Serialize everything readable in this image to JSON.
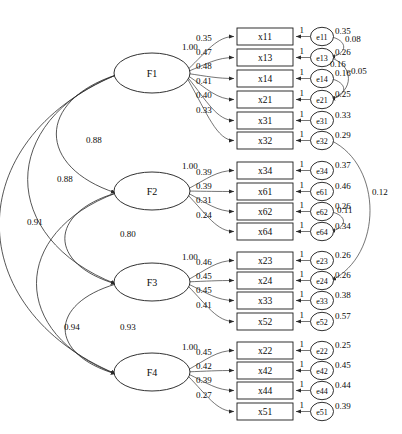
{
  "diagram": {
    "type": "sem-path-diagram",
    "stroke_color": "#2b2b2b",
    "fill_color": "#ffffff",
    "unit_label": "1"
  },
  "factors": [
    {
      "id": "F1",
      "label": "F1",
      "cx": 152,
      "cy": 73,
      "rx": 38,
      "ry": 20,
      "first_loading": "1.00",
      "loadings": [
        "0.35",
        "0.47",
        "0.48",
        "0.41",
        "0.40",
        "0.33"
      ]
    },
    {
      "id": "F2",
      "label": "F2",
      "cx": 152,
      "cy": 191,
      "rx": 38,
      "ry": 19,
      "first_loading": "1.00",
      "loadings": [
        "0.39",
        "0.39",
        "0.31",
        "0.24"
      ]
    },
    {
      "id": "F3",
      "label": "F3",
      "cx": 152,
      "cy": 282,
      "rx": 38,
      "ry": 19,
      "first_loading": "1.00",
      "loadings": [
        "0.46",
        "0.45",
        "0.45",
        "0.41"
      ]
    },
    {
      "id": "F4",
      "label": "F4",
      "cx": 152,
      "cy": 372,
      "rx": 38,
      "ry": 19,
      "first_loading": "1.00",
      "loadings": [
        "0.45",
        "0.42",
        "0.39",
        "0.27"
      ]
    }
  ],
  "indicators": [
    {
      "id": "x11",
      "label": "x11",
      "factor": "F1",
      "y": 28,
      "error": "e11",
      "error_var": "0.35"
    },
    {
      "id": "x13",
      "label": "x13",
      "factor": "F1",
      "y": 49,
      "error": "e13",
      "error_var": "0.26"
    },
    {
      "id": "x14",
      "label": "x14",
      "factor": "F1",
      "y": 70,
      "error": "e14",
      "error_var": "0.16"
    },
    {
      "id": "x21",
      "label": "x21",
      "factor": "F1",
      "y": 91,
      "error": "e21",
      "error_var": "0.25"
    },
    {
      "id": "x31",
      "label": "x31",
      "factor": "F1",
      "y": 112,
      "error": "e31",
      "error_var": "0.33"
    },
    {
      "id": "x32",
      "label": "x32",
      "factor": "F1",
      "y": 132,
      "error": "e32",
      "error_var": "0.29"
    },
    {
      "id": "x34",
      "label": "x34",
      "factor": "F2",
      "y": 162,
      "error": "e34",
      "error_var": "0.37"
    },
    {
      "id": "x61",
      "label": "x61",
      "factor": "F2",
      "y": 183,
      "error": "e61",
      "error_var": "0.46"
    },
    {
      "id": "x62",
      "label": "x62",
      "factor": "F2",
      "y": 203,
      "error": "e62",
      "error_var": "0.26"
    },
    {
      "id": "x64",
      "label": "x64",
      "factor": "F2",
      "y": 223,
      "error": "e64",
      "error_var": "0.34"
    },
    {
      "id": "x23",
      "label": "x23",
      "factor": "F3",
      "y": 252,
      "error": "e23",
      "error_var": "0.26"
    },
    {
      "id": "x24",
      "label": "x24",
      "factor": "F3",
      "y": 272,
      "error": "e24",
      "error_var": "0.26"
    },
    {
      "id": "x33",
      "label": "x33",
      "factor": "F3",
      "y": 292,
      "error": "e33",
      "error_var": "0.38"
    },
    {
      "id": "x52",
      "label": "x52",
      "factor": "F3",
      "y": 313,
      "error": "e52",
      "error_var": "0.57"
    },
    {
      "id": "x22",
      "label": "x22",
      "factor": "F4",
      "y": 342,
      "error": "e22",
      "error_var": "0.25"
    },
    {
      "id": "x42",
      "label": "x42",
      "factor": "F4",
      "y": 362,
      "error": "e42",
      "error_var": "0.45"
    },
    {
      "id": "x44",
      "label": "x44",
      "factor": "F4",
      "y": 382,
      "error": "e44",
      "error_var": "0.44"
    },
    {
      "id": "x51",
      "label": "x51",
      "factor": "F4",
      "y": 403,
      "error": "e51",
      "error_var": "0.39"
    }
  ],
  "factor_correlations": [
    {
      "from": "F1",
      "to": "F2",
      "value": "0.88",
      "lx": 86,
      "ly": 143
    },
    {
      "from": "F1",
      "to": "F3",
      "value": "0.88",
      "lx": 57,
      "ly": 182
    },
    {
      "from": "F1",
      "to": "F4",
      "value": "0.91",
      "lx": 27,
      "ly": 225
    },
    {
      "from": "F2",
      "to": "F3",
      "value": "0.80",
      "lx": 120,
      "ly": 237
    },
    {
      "from": "F2",
      "to": "F4",
      "value": "0.94",
      "lx": 64,
      "ly": 330
    },
    {
      "from": "F3",
      "to": "F4",
      "value": "0.93",
      "lx": 120,
      "ly": 330
    }
  ],
  "error_covariances": [
    {
      "from": "e11",
      "to": "e13",
      "value": "0.08",
      "lx": 345,
      "ly": 42
    },
    {
      "from": "e13",
      "to": "e21",
      "value": "0.16",
      "lx": 330,
      "ly": 67
    },
    {
      "from": "e14",
      "to": "e21",
      "value": "-0.05",
      "lx": 348,
      "ly": 74
    },
    {
      "from": "e62",
      "to": "e64",
      "value": "0.11",
      "lx": 337,
      "ly": 213
    },
    {
      "from": "e32",
      "to": "e24",
      "value": "0.12",
      "lx": 372,
      "ly": 195
    }
  ],
  "chart_data": {
    "type": "diagram",
    "latent_variables": [
      "F1",
      "F2",
      "F3",
      "F4"
    ],
    "observed_variables": [
      "x11",
      "x13",
      "x14",
      "x21",
      "x31",
      "x32",
      "x34",
      "x61",
      "x62",
      "x64",
      "x23",
      "x24",
      "x33",
      "x52",
      "x22",
      "x42",
      "x44",
      "x51"
    ],
    "error_terms": [
      "e11",
      "e13",
      "e14",
      "e21",
      "e31",
      "e32",
      "e34",
      "e61",
      "e62",
      "e64",
      "e23",
      "e24",
      "e33",
      "e52",
      "e22",
      "e42",
      "e44",
      "e51"
    ],
    "loadings": {
      "F1": [
        "1.00",
        "0.35",
        "0.47",
        "0.48",
        "0.41",
        "0.40",
        "0.33"
      ],
      "F2": [
        "1.00",
        "0.39",
        "0.39",
        "0.31",
        "0.24"
      ],
      "F3": [
        "1.00",
        "0.46",
        "0.45",
        "0.45",
        "0.41"
      ],
      "F4": [
        "1.00",
        "0.45",
        "0.42",
        "0.39",
        "0.27"
      ]
    },
    "error_variances": {
      "e11": "0.35",
      "e13": "0.26",
      "e14": "0.16",
      "e21": "0.25",
      "e31": "0.33",
      "e32": "0.29",
      "e34": "0.37",
      "e61": "0.46",
      "e62": "0.26",
      "e64": "0.34",
      "e23": "0.26",
      "e24": "0.26",
      "e33": "0.38",
      "e52": "0.57",
      "e22": "0.25",
      "e42": "0.45",
      "e44": "0.44",
      "e51": "0.39"
    },
    "factor_correlations": {
      "F1-F2": "0.88",
      "F1-F3": "0.88",
      "F1-F4": "0.91",
      "F2-F3": "0.80",
      "F2-F4": "0.94",
      "F3-F4": "0.93"
    },
    "error_covariances": {
      "e11-e13": "0.08",
      "e13-e21": "0.16",
      "e14-e21": "-0.05",
      "e62-e64": "0.11",
      "e32-e24": "0.12"
    },
    "error_path_coefficient": "1"
  }
}
